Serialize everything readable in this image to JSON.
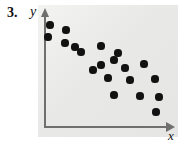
{
  "problem": {
    "number": "3."
  },
  "axes": {
    "y_label": "y",
    "x_label": "x",
    "y_axis_icon": "arrow-up-icon",
    "x_axis_icon": "arrow-right-icon"
  },
  "chart_data": {
    "type": "scatter",
    "title": "",
    "xlabel": "x",
    "ylabel": "y",
    "grid": false,
    "legend": null,
    "ticks": {
      "x": [],
      "y": []
    },
    "xlim": [
      0,
      100
    ],
    "ylim": [
      0,
      100
    ],
    "correlation": "negative",
    "n_points": 20,
    "points": [
      {
        "x": 5,
        "y": 92
      },
      {
        "x": 4,
        "y": 81
      },
      {
        "x": 18,
        "y": 88
      },
      {
        "x": 17,
        "y": 76
      },
      {
        "x": 24,
        "y": 73
      },
      {
        "x": 49,
        "y": 75
      },
      {
        "x": 62,
        "y": 69
      },
      {
        "x": 59,
        "y": 62
      },
      {
        "x": 48,
        "y": 57
      },
      {
        "x": 41,
        "y": 53
      },
      {
        "x": 69,
        "y": 54
      },
      {
        "x": 84,
        "y": 58
      },
      {
        "x": 55,
        "y": 46
      },
      {
        "x": 73,
        "y": 44
      },
      {
        "x": 93,
        "y": 45
      },
      {
        "x": 61,
        "y": 33
      },
      {
        "x": 82,
        "y": 32
      },
      {
        "x": 99,
        "y": 31
      },
      {
        "x": 95,
        "y": 18
      },
      {
        "x": 30,
        "y": 68
      }
    ],
    "pixel_points": [
      {
        "cx": 50,
        "cy": 25,
        "r": 3.6
      },
      {
        "cx": 48,
        "cy": 37,
        "r": 3.6
      },
      {
        "cx": 66,
        "cy": 30,
        "r": 3.6
      },
      {
        "cx": 65,
        "cy": 43,
        "r": 3.6
      },
      {
        "cx": 75,
        "cy": 47,
        "r": 3.6
      },
      {
        "cx": 101,
        "cy": 46,
        "r": 3.6
      },
      {
        "cx": 118,
        "cy": 53,
        "r": 3.6
      },
      {
        "cx": 114,
        "cy": 60,
        "r": 3.6
      },
      {
        "cx": 101,
        "cy": 65,
        "r": 3.6
      },
      {
        "cx": 93,
        "cy": 70,
        "r": 3.6
      },
      {
        "cx": 125,
        "cy": 68,
        "r": 3.6
      },
      {
        "cx": 144,
        "cy": 64,
        "r": 3.6
      },
      {
        "cx": 108,
        "cy": 78,
        "r": 3.6
      },
      {
        "cx": 130,
        "cy": 80,
        "r": 3.6
      },
      {
        "cx": 155,
        "cy": 79,
        "r": 3.6
      },
      {
        "cx": 114,
        "cy": 95,
        "r": 3.6
      },
      {
        "cx": 140,
        "cy": 96,
        "r": 3.6
      },
      {
        "cx": 159,
        "cy": 97,
        "r": 3.6
      },
      {
        "cx": 156,
        "cy": 112,
        "r": 3.6
      },
      {
        "cx": 81,
        "cy": 52,
        "r": 3.6
      }
    ]
  },
  "colors": {
    "point": "#121212",
    "axis": "#6f6f6f",
    "panel_background": "#e9e9e7",
    "page_background": "#ffffff",
    "text": "#111111"
  }
}
